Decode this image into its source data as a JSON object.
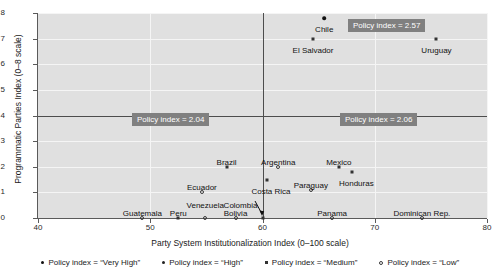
{
  "chart_data": {
    "type": "scatter",
    "title": "",
    "xlabel": "Party System Institutionalization Index (0–100 scale)",
    "ylabel": "Programmatic Parties Index (0–8 scale)",
    "xlim": [
      40,
      80
    ],
    "ylim": [
      0,
      8
    ],
    "xticks": [
      40,
      50,
      60,
      70,
      80
    ],
    "yticks": [
      0,
      1,
      2,
      3,
      4,
      5,
      6,
      7,
      8
    ],
    "grid": true,
    "legend_position": "bottom",
    "reference_lines": {
      "horizontal_y": 4,
      "vertical_x": 60
    },
    "quadrant_annotations": [
      {
        "id": "top-left",
        "label": "Policy index = 2.04"
      },
      {
        "id": "top-right",
        "label": "Policy index = 2.57"
      },
      {
        "id": "bottom-right",
        "label": "Policy index = 2.06"
      }
    ],
    "legend": [
      {
        "key": "veryhigh",
        "label": "Policy index = “Very High”"
      },
      {
        "key": "high",
        "label": "Policy index = “High”"
      },
      {
        "key": "medium",
        "label": "Policy index = “Medium”"
      },
      {
        "key": "low",
        "label": "Policy index = “Low”"
      }
    ],
    "points": [
      {
        "name": "Chile",
        "x": 65.5,
        "y": 7.8,
        "category": "veryhigh",
        "label_pos": "below",
        "label_dx": 0,
        "label_dy": 7
      },
      {
        "name": "El Salvador",
        "x": 64.5,
        "y": 7.0,
        "category": "medium",
        "label_pos": "below",
        "label_dx": 0,
        "label_dy": 7
      },
      {
        "name": "Uruguay",
        "x": 75.5,
        "y": 7.0,
        "category": "medium",
        "label_pos": "below",
        "label_dx": 0,
        "label_dy": 7
      },
      {
        "name": "Brazil",
        "x": 56.8,
        "y": 2.0,
        "category": "medium",
        "label_pos": "above",
        "label_dx": 0,
        "label_dy": -4
      },
      {
        "name": "Argentina",
        "x": 61.4,
        "y": 2.0,
        "category": "low",
        "label_pos": "above",
        "label_dx": 0,
        "label_dy": -4
      },
      {
        "name": "Mexico",
        "x": 66.8,
        "y": 2.0,
        "category": "medium",
        "label_pos": "above",
        "label_dx": 0,
        "label_dy": -4
      },
      {
        "name": "Honduras",
        "x": 68.0,
        "y": 1.8,
        "category": "medium",
        "label_pos": "below",
        "label_dx": 4,
        "label_dy": 7
      },
      {
        "name": "Paraguay",
        "x": 64.3,
        "y": 1.1,
        "category": "low",
        "label_pos": "above",
        "label_dx": 0,
        "label_dy": -4
      },
      {
        "name": "Ecuador",
        "x": 54.6,
        "y": 1.0,
        "category": "low",
        "label_pos": "above",
        "label_dx": 0,
        "label_dy": -4
      },
      {
        "name": "Costa Rica",
        "x": 60.4,
        "y": 1.5,
        "category": "medium",
        "label_pos": "below",
        "label_dx": 4,
        "label_dy": 7
      },
      {
        "name": "Colombia",
        "x": 60.0,
        "y": 0.0,
        "category": "medium",
        "label_pos": "arrow",
        "label_dx": -22,
        "label_dy": -12
      },
      {
        "name": "Guatemala",
        "x": 49.3,
        "y": 0.0,
        "category": "low",
        "label_pos": "above",
        "label_dx": 0,
        "label_dy": -4
      },
      {
        "name": "Peru",
        "x": 52.5,
        "y": 0.0,
        "category": "medium",
        "label_pos": "above",
        "label_dx": 0,
        "label_dy": -4
      },
      {
        "name": "Venezuela",
        "x": 54.9,
        "y": 0.0,
        "category": "low",
        "label_pos": "above",
        "label_dx": 0,
        "label_dy": -12
      },
      {
        "name": "Bolivia",
        "x": 57.6,
        "y": 0.0,
        "category": "low",
        "label_pos": "above",
        "label_dx": 0,
        "label_dy": -4
      },
      {
        "name": "Panama",
        "x": 66.2,
        "y": 0.0,
        "category": "low",
        "label_pos": "above",
        "label_dx": 0,
        "label_dy": -4
      },
      {
        "name": "Dominican Rep.",
        "x": 74.2,
        "y": 0.0,
        "category": "low",
        "label_pos": "above",
        "label_dx": 0,
        "label_dy": -4
      }
    ],
    "colors": {
      "plot_background": "#e0e0e0",
      "grid": "#f5f5f5",
      "reference_line": "#4d4d4d",
      "annotation_background": "#808080",
      "annotation_text": "#ffffff",
      "marker": "#111111"
    }
  }
}
